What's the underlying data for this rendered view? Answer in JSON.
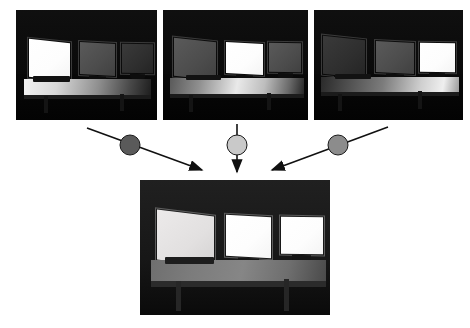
{
  "figure": {
    "type": "exposure-fusion-diagram",
    "background_color": "#ffffff",
    "width": 470,
    "height": 328,
    "caption": ""
  },
  "inputs": [
    {
      "id": "exposure-1",
      "name": "input-exposure-left-monitor",
      "label": "",
      "x": 16,
      "y": 10,
      "w": 141,
      "h": 110,
      "frame_color": "#000000",
      "exposed_monitor": "left",
      "monitor_levels": [
        "blown",
        "dim",
        "dark"
      ],
      "desk_level": "bright",
      "description": "Dark room, left monitor over-exposed to white, desk lit on the left"
    },
    {
      "id": "exposure-2",
      "name": "input-exposure-center-monitor",
      "label": "",
      "x": 163,
      "y": 10,
      "w": 145,
      "h": 110,
      "frame_color": "#000000",
      "exposed_monitor": "center",
      "monitor_levels": [
        "dim",
        "blown",
        "dim"
      ],
      "desk_level": "mid",
      "description": "Dark room, center monitor over-exposed to white, desk lit in the middle"
    },
    {
      "id": "exposure-3",
      "name": "input-exposure-right-monitor",
      "label": "",
      "x": 314,
      "y": 10,
      "w": 149,
      "h": 110,
      "frame_color": "#000000",
      "exposed_monitor": "right",
      "monitor_levels": [
        "dark",
        "dim",
        "blown"
      ],
      "desk_level": "mid",
      "description": "Dark room, right monitor over-exposed to white, desk lit on the right"
    }
  ],
  "weights": [
    {
      "id": "weight-left",
      "name": "weight-node-left",
      "color": "#5a5a5a",
      "cx": 130,
      "cy": 145,
      "r": 10,
      "label": ""
    },
    {
      "id": "weight-center",
      "name": "weight-node-center",
      "color": "#c9c9c9",
      "cx": 237,
      "cy": 145,
      "r": 10,
      "label": ""
    },
    {
      "id": "weight-right",
      "name": "weight-node-right",
      "color": "#8c8c8c",
      "cx": 338,
      "cy": 145,
      "r": 10,
      "label": ""
    }
  ],
  "arrows": [
    {
      "id": "arrow-left",
      "name": "arrow-left-to-output",
      "x1": 87,
      "y1": 128,
      "x2": 202,
      "y2": 170,
      "color": "#111111",
      "direction": "down-right"
    },
    {
      "id": "arrow-center",
      "name": "arrow-center-to-output",
      "x1": 237,
      "y1": 124,
      "x2": 237,
      "y2": 172,
      "color": "#111111",
      "direction": "down"
    },
    {
      "id": "arrow-right",
      "name": "arrow-right-to-output",
      "x1": 388,
      "y1": 127,
      "x2": 272,
      "y2": 170,
      "color": "#111111",
      "direction": "down-left"
    }
  ],
  "output": {
    "id": "fused-result",
    "name": "output-fused-image",
    "label": "",
    "x": 140,
    "y": 180,
    "w": 190,
    "h": 135,
    "frame_color": "#000000",
    "monitor_levels": [
      "bright",
      "blown",
      "blown"
    ],
    "desk_level": "mid",
    "description": "Fused high-dynamic-range result: all three monitors correctly exposed and the desk visible"
  },
  "colors": {
    "page_background": "#ffffff",
    "photo_background": "#000000",
    "arrow": "#111111",
    "weight_dark": "#5a5a5a",
    "weight_light": "#c9c9c9",
    "weight_mid": "#8c8c8c"
  }
}
